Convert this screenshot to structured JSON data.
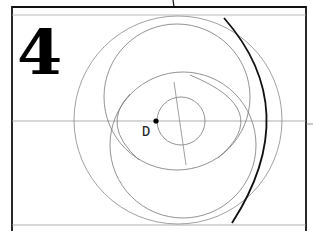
{
  "figure": {
    "step_number": "4",
    "point_label": "D",
    "colors": {
      "frame": "#111111",
      "guide_line": "#9a9a9a",
      "construction_circle": "#7a7a7a",
      "highlight_arc": "#111111",
      "point": "#000000"
    },
    "elements": {
      "frame": {
        "x1": 12,
        "y1": 7,
        "x2": 306,
        "y2": 231
      },
      "top_border_line_y": 15,
      "bottom_border_line_y": 225,
      "horizontal_axis_y": 121,
      "top_connector": {
        "x": 173,
        "y1": 0,
        "y2": 7
      },
      "right_tick": {
        "x1": 306,
        "x2": 313,
        "y": 124
      },
      "outer_circle": {
        "cx": 178,
        "cy": 120,
        "r": 104
      },
      "upper_circle": {
        "cx": 177,
        "cy": 97,
        "r": 73
      },
      "lower_circle": {
        "cx": 183,
        "cy": 145,
        "r": 73
      },
      "small_circle": {
        "cx": 181,
        "cy": 121,
        "r": 24
      },
      "point_D": {
        "cx": 156,
        "cy": 121,
        "r": 2.5
      }
    }
  }
}
